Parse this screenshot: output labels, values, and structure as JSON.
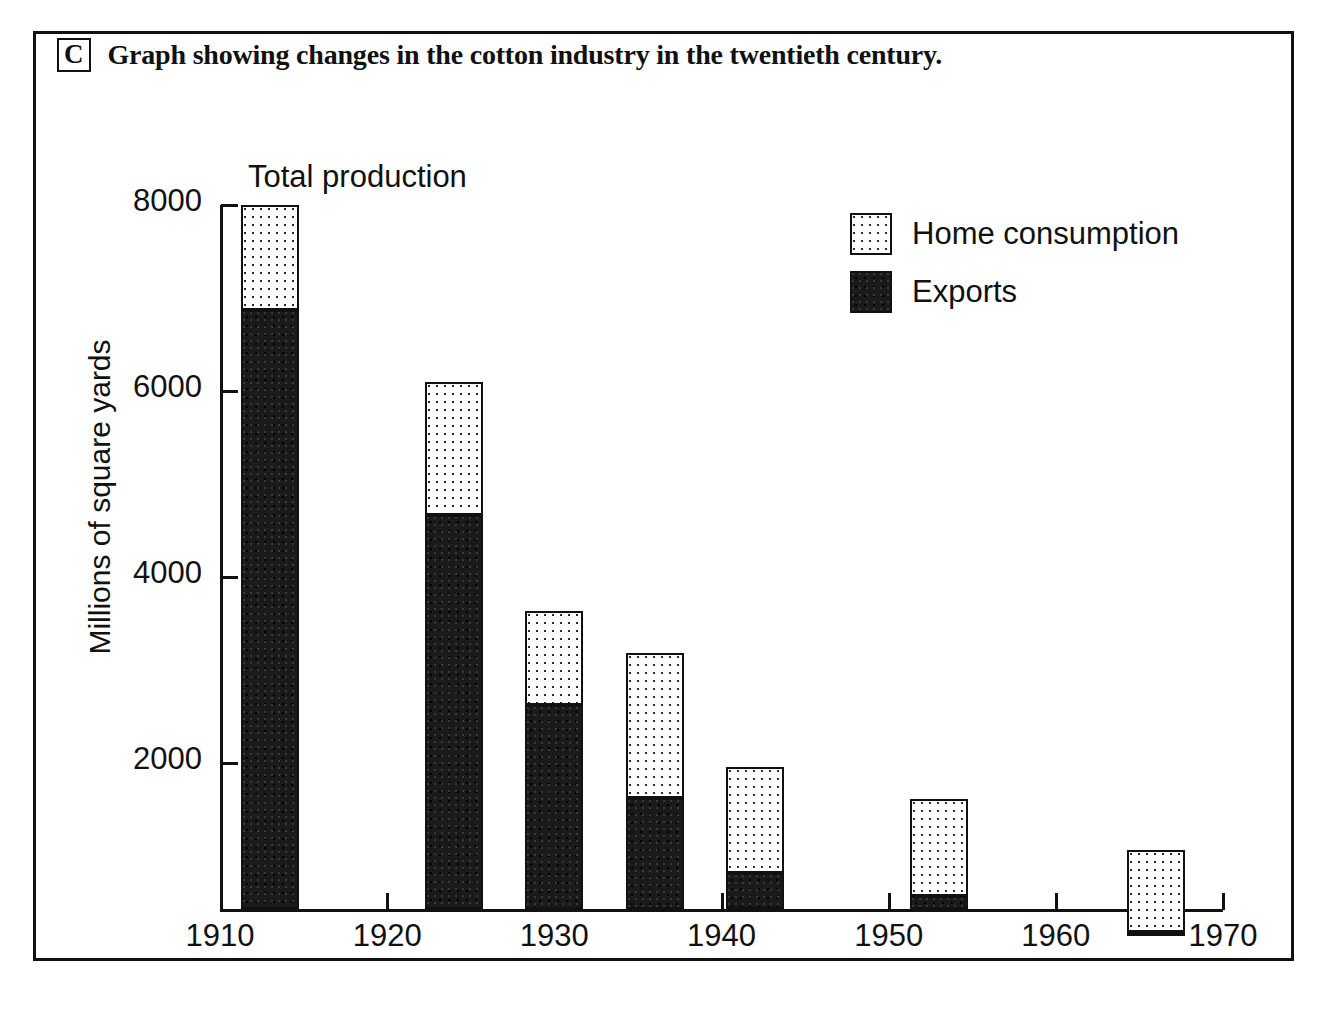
{
  "caption": {
    "letter": "C",
    "text": "Graph showing changes in the cotton industry in the twentieth century."
  },
  "annotation": {
    "total_production": "Total production"
  },
  "legend": {
    "position": "inside-top-right",
    "items": [
      {
        "label": "Home consumption",
        "swatch": "stipple-light-swatch",
        "color": "#ffffff"
      },
      {
        "label": "Exports",
        "swatch": "stipple-dark-swatch",
        "color": "#1a1a1a"
      }
    ]
  },
  "chart_data": {
    "type": "bar",
    "stacked": true,
    "title": "Graph showing changes in the cotton industry in the twentieth century.",
    "xlabel": "",
    "ylabel": "Millions of square yards",
    "xlim": [
      1910,
      1970
    ],
    "ylim": [
      0,
      8000
    ],
    "grid": false,
    "legend_position": "top right",
    "x_tick_labels": [
      "1910",
      "1920",
      "1930",
      "1940",
      "1950",
      "1960",
      "1970"
    ],
    "x_ticks": [
      1910,
      1920,
      1930,
      1940,
      1950,
      1960,
      1970
    ],
    "y_tick_labels": [
      "2000",
      "4000",
      "6000",
      "8000"
    ],
    "y_ticks": [
      2000,
      4000,
      6000,
      8000
    ],
    "categories": [
      1913,
      1924,
      1930,
      1936,
      1942,
      1953,
      1966
    ],
    "series": [
      {
        "name": "Exports",
        "values": [
          6870,
          4670,
          2620,
          1620,
          820,
          570,
          180
        ]
      },
      {
        "name": "Home consumption",
        "values": [
          1130,
          1430,
          1010,
          1560,
          1140,
          1040,
          880
        ]
      }
    ],
    "totals": [
      8000,
      6100,
      3630,
      3180,
      1960,
      1610,
      1060
    ],
    "annotations": [
      {
        "text": "Total production",
        "target_year": 1913,
        "target_value": 8000
      }
    ]
  }
}
